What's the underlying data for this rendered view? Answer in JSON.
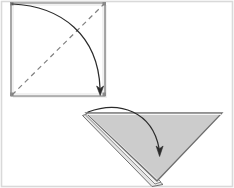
{
  "figure": {
    "width": 234,
    "height": 188,
    "background_color": "#ffffff",
    "border_color": "#d9d9d9"
  },
  "colors": {
    "background": "#ffffff",
    "outer_border": "#d9d9d9",
    "paper_outline": "#6e6e6e",
    "paper_outline_dark": "#404040",
    "paper_fill_white": "#ffffff",
    "paper_fill_gray": "#cccccc",
    "paper_fill_gray_under": "#e2e2e2",
    "fold_line_dashed": "#808080",
    "arrow_stroke": "#333333"
  },
  "steps": [
    {
      "id": "step-1",
      "name": "square-sheet",
      "shape": "square",
      "label": "",
      "fill": "#ffffff",
      "stroke": "#6e6e6e",
      "points": "11,3 105,3 105,96 11,96",
      "fold_line": {
        "name": "diagonal-fold-crease",
        "style": "dashed",
        "dash_pattern": "5 4",
        "from": [
          12,
          95
        ],
        "to": [
          104,
          4
        ]
      },
      "arrow": {
        "name": "fold-direction-arrow",
        "path": "M 12 4 C 62 6 98 36 100 88",
        "head_at": [
          100,
          94
        ],
        "head_angle_deg": 90
      }
    },
    {
      "id": "step-2",
      "name": "folded-triangle",
      "shape": "triangle-down",
      "label": "",
      "fill": "#cccccc",
      "stroke": "#6e6e6e",
      "points": "86,113 222,113 157,181",
      "under_layer": {
        "name": "under-flap-sliver",
        "fill": "#e2e2e2",
        "points": "83,116 152,186 162,184 88,114"
      },
      "arrow": {
        "name": "fold-direction-arrow",
        "path": "M 88 112 C 120 100 152 112 159 148",
        "head_at": [
          160,
          156
        ],
        "head_angle_deg": 90
      }
    }
  ],
  "annotations": []
}
